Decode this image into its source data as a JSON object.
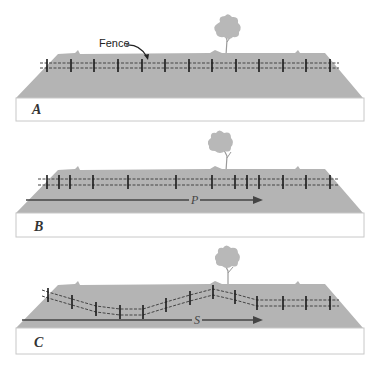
{
  "colors": {
    "ground": "#b4b4b4",
    "ground_edge": "#a8a8a8",
    "front_face": "#ffffff",
    "front_border": "#c8c8c8",
    "wire": "#444444",
    "post": "#1a1a1a",
    "tree": "#b8b8b8",
    "arrow": "#444444"
  },
  "panels": [
    {
      "id": "A",
      "letter": "A",
      "callout": "Fence",
      "arrow_label": null,
      "posts": [
        [
          47,
          66
        ],
        [
          71,
          66
        ],
        [
          94,
          66
        ],
        [
          118,
          66
        ],
        [
          142,
          66
        ],
        [
          165,
          66
        ],
        [
          189,
          66
        ],
        [
          212,
          66
        ],
        [
          236,
          66
        ],
        [
          259,
          66
        ],
        [
          283,
          66
        ],
        [
          306,
          66
        ],
        [
          330,
          66
        ]
      ]
    },
    {
      "id": "B",
      "letter": "B",
      "callout": null,
      "arrow_label": "P",
      "posts": [
        [
          47,
          182
        ],
        [
          59,
          182
        ],
        [
          70,
          182
        ],
        [
          93,
          182
        ],
        [
          128,
          182
        ],
        [
          176,
          182
        ],
        [
          212,
          182
        ],
        [
          235,
          182
        ],
        [
          247,
          182
        ],
        [
          259,
          182
        ],
        [
          283,
          182
        ],
        [
          306,
          182
        ],
        [
          330,
          182
        ]
      ]
    },
    {
      "id": "C",
      "letter": "C",
      "callout": null,
      "arrow_label": "S",
      "posts": [
        [
          48,
          295
        ],
        [
          72,
          302
        ],
        [
          96,
          309
        ],
        [
          120,
          312
        ],
        [
          143,
          312
        ],
        [
          166,
          305
        ],
        [
          190,
          298
        ],
        [
          213,
          292
        ],
        [
          235,
          297
        ],
        [
          257,
          303
        ],
        [
          283,
          303
        ],
        [
          306,
          303
        ],
        [
          330,
          303
        ]
      ]
    }
  ]
}
